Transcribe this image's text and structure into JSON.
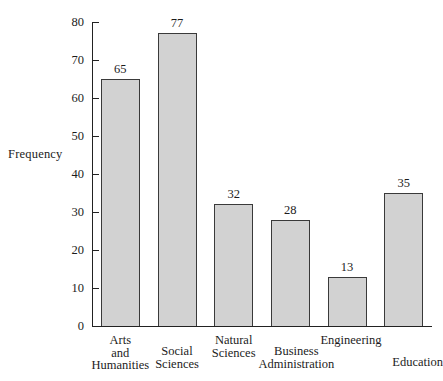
{
  "chart_data": {
    "type": "bar",
    "title": "",
    "xlabel": "",
    "ylabel": "Frequency",
    "ylim": [
      0,
      80
    ],
    "ytick_step": 10,
    "yticks": [
      80,
      70,
      60,
      50,
      40,
      30,
      20,
      10,
      0
    ],
    "grid": false,
    "legend": null,
    "categories": [
      "Arts and Humanities",
      "Social Sciences",
      "Natural Sciences",
      "Business Administration",
      "Engineering",
      "Education"
    ],
    "category_lines": [
      [
        "Arts",
        "and",
        "Humanities"
      ],
      [
        "Social",
        "Sciences"
      ],
      [
        "Natural",
        "Sciences"
      ],
      [
        "Business",
        "Administration"
      ],
      [
        "Engineering"
      ],
      [
        "Education"
      ]
    ],
    "values": [
      65,
      77,
      32,
      28,
      13,
      35
    ],
    "value_labels": [
      "65",
      "77",
      "32",
      "28",
      "13",
      "35"
    ],
    "colors": {
      "bar_fill": "#d2d2d2",
      "bar_edge": "#3a3a3a",
      "axis": "#222222",
      "text": "#1c1c1c",
      "background": "#ffffff"
    }
  },
  "axis": {
    "y_title": "Frequency",
    "y_tick_labels": [
      "80",
      "70",
      "60",
      "50",
      "40",
      "30",
      "20",
      "10",
      "0"
    ]
  }
}
